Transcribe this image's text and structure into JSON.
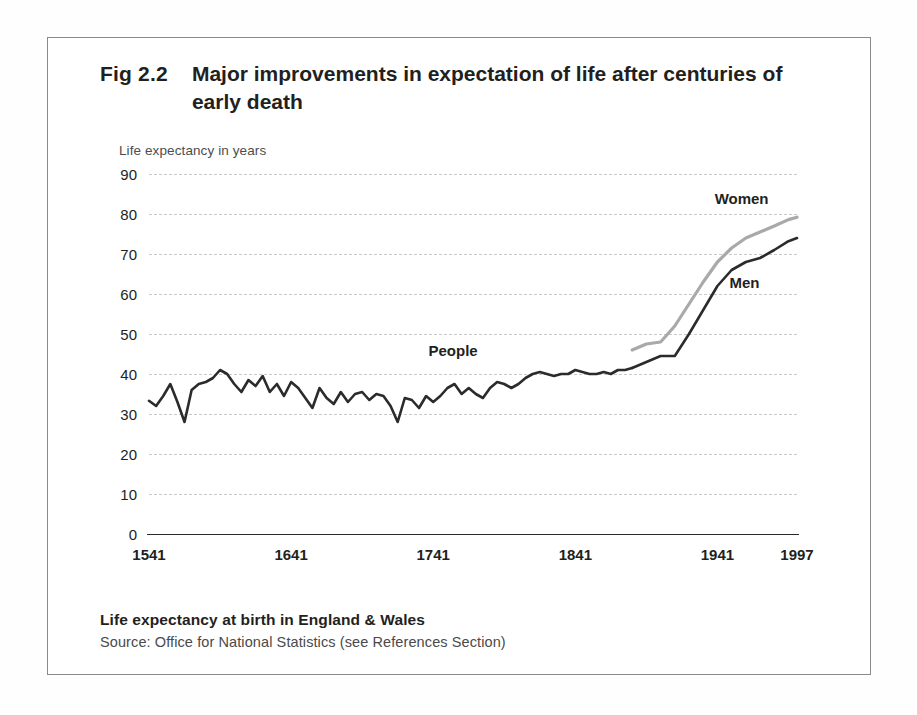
{
  "figure": {
    "id_label": "Fig 2.2",
    "title": "Major improvements in expectation of life after centuries of early death",
    "footer_title": "Life expectancy at birth in England & Wales",
    "footer_source": "Source: Office for National Statistics (see References Section)"
  },
  "colors": {
    "ink": "#231f20",
    "people_line": "#2b2b2b",
    "men_line": "#2b2b2b",
    "women_line": "#a9a9a9",
    "gridline": "#c9c9c9",
    "axis": "#2b2b2b",
    "frame": "#8a8a8a"
  },
  "chart_data": {
    "type": "line",
    "title": "Major improvements in expectation of life after centuries of early death",
    "xlabel": "",
    "ylabel": "Life expectancy in years",
    "xlim": [
      1541,
      1997
    ],
    "ylim": [
      0,
      90
    ],
    "ytick_values": [
      90,
      80,
      70,
      60,
      50,
      40,
      30,
      20,
      10,
      0
    ],
    "ytick_labels": [
      "90",
      "80",
      "70",
      "60",
      "50",
      "40",
      "30",
      "20",
      "10",
      "0"
    ],
    "xtick_values": [
      1541,
      1641,
      1741,
      1841,
      1941,
      1997
    ],
    "xtick_labels": [
      "1541",
      "1641",
      "1741",
      "1841",
      "1941",
      "1997"
    ],
    "grid": true,
    "legend_position": "inline-annotations",
    "annotations": [
      {
        "text": "People",
        "x": 1755,
        "y": 46
      },
      {
        "text": "Women",
        "x": 1958,
        "y": 84
      },
      {
        "text": "Men",
        "x": 1960,
        "y": 63
      }
    ],
    "series": [
      {
        "name": "People",
        "color": "#2b2b2b",
        "x": [
          1541,
          1546,
          1551,
          1556,
          1561,
          1566,
          1571,
          1576,
          1581,
          1586,
          1591,
          1596,
          1601,
          1606,
          1611,
          1616,
          1621,
          1626,
          1631,
          1636,
          1641,
          1646,
          1651,
          1656,
          1661,
          1666,
          1671,
          1676,
          1681,
          1686,
          1691,
          1696,
          1701,
          1706,
          1711,
          1716,
          1721,
          1726,
          1731,
          1736,
          1741,
          1746,
          1751,
          1756,
          1761,
          1766,
          1771,
          1776,
          1781,
          1786,
          1791,
          1796,
          1801,
          1806,
          1811,
          1816,
          1821,
          1826,
          1831,
          1836,
          1841,
          1846,
          1851,
          1856,
          1861,
          1866,
          1871,
          1876,
          1881
        ],
        "y": [
          33.3,
          32.0,
          34.5,
          37.5,
          33.0,
          28.0,
          36.0,
          37.5,
          38.0,
          39.0,
          41.0,
          40.0,
          37.5,
          35.5,
          38.5,
          37.0,
          39.5,
          35.5,
          37.5,
          34.5,
          38.0,
          36.5,
          34.0,
          31.5,
          36.5,
          34.0,
          32.5,
          35.5,
          33.0,
          35.0,
          35.5,
          33.5,
          35.0,
          34.5,
          32.0,
          28.0,
          34.0,
          33.5,
          31.5,
          34.5,
          33.0,
          34.5,
          36.5,
          37.5,
          35.0,
          36.5,
          35.0,
          34.0,
          36.5,
          38.0,
          37.5,
          36.5,
          37.5,
          39.0,
          40.0,
          40.5,
          40.0,
          39.5,
          40.0,
          40.0,
          41.0,
          40.5,
          40.0,
          40.0,
          40.5,
          40.0,
          41.0,
          41.0,
          41.5
        ]
      },
      {
        "name": "Men",
        "color": "#2b2b2b",
        "x": [
          1881,
          1891,
          1901,
          1911,
          1921,
          1931,
          1941,
          1951,
          1961,
          1971,
          1981,
          1991,
          1997
        ],
        "y": [
          41.5,
          43.0,
          44.5,
          44.5,
          50.0,
          56.0,
          62.0,
          66.0,
          68.0,
          69.0,
          71.0,
          73.2,
          74.0
        ]
      },
      {
        "name": "Women",
        "color": "#a9a9a9",
        "x": [
          1881,
          1891,
          1901,
          1911,
          1921,
          1931,
          1941,
          1951,
          1961,
          1971,
          1981,
          1991,
          1997
        ],
        "y": [
          46.0,
          47.5,
          48.0,
          52.0,
          57.5,
          63.0,
          68.0,
          71.5,
          74.0,
          75.5,
          77.0,
          78.6,
          79.2
        ]
      }
    ]
  }
}
